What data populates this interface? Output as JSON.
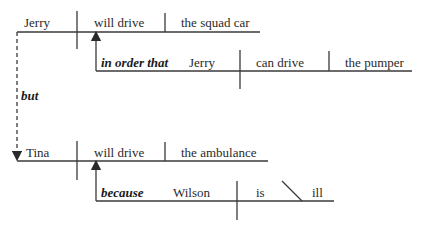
{
  "diagram": {
    "type": "Reed-Kellogg sentence diagram",
    "clause1": {
      "subject": "Jerry",
      "verb": "will drive",
      "object": "the squad car",
      "subordinate": {
        "conjunction": "in order that",
        "subject": "Jerry",
        "verb": "can drive",
        "object": "the pumper"
      }
    },
    "coordinator": "but",
    "clause2": {
      "subject": "Tina",
      "verb": "will drive",
      "object": "the ambulance",
      "subordinate": {
        "conjunction": "because",
        "subject": "Wilson",
        "verb": "is",
        "complement": "ill"
      }
    },
    "colors": {
      "line": "#3a3a3a",
      "text": "#2a2a2a"
    }
  }
}
